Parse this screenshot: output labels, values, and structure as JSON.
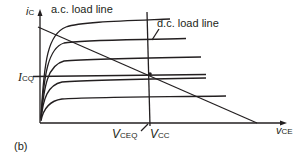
{
  "figure": {
    "panel_label": "(b)",
    "y_axis": {
      "symbol": "i",
      "subscript": "C"
    },
    "x_axis": {
      "symbol": "v",
      "subscript": "CE"
    },
    "labels": {
      "ac_load_line": "a.c. load line",
      "dc_load_line": "d.c. load line",
      "icq": {
        "symbol": "I",
        "subscript": "CQ"
      },
      "vceq": {
        "symbol": "V",
        "subscript": "CEQ"
      },
      "vcc": {
        "symbol": "V",
        "subscript": "CC"
      }
    },
    "colors": {
      "ink": "#231f20",
      "background": "#ffffff"
    }
  }
}
